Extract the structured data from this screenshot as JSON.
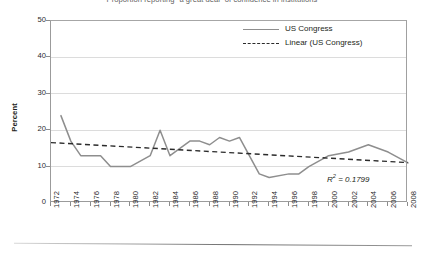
{
  "title": "Proportion reporting “a great deal” of confidence in institutions",
  "axes": {
    "y_title": "Percent",
    "y_ticks": [
      "50",
      "40",
      "30",
      "20",
      "10",
      "0"
    ],
    "x_ticks": [
      "1972",
      "1974",
      "1976",
      "1978",
      "1980",
      "1982",
      "1984",
      "1986",
      "1988",
      "1990",
      "1992",
      "1994",
      "1996",
      "1998",
      "2000",
      "2002",
      "2004",
      "2006",
      "2008"
    ]
  },
  "legend": {
    "items": [
      {
        "label": "US Congress",
        "style": "solid",
        "color": "#8e8e8e"
      },
      {
        "label": "Linear (US Congress)",
        "style": "dashed",
        "color": "#2b2b2b"
      }
    ]
  },
  "annotation": {
    "r_squared_prefix": "R",
    "r_squared_exponent": "2",
    "r_squared_value": " = 0.1799",
    "r_squared_full": "R2 = 0.1799"
  },
  "colors": {
    "series_line": "#8e8e8e",
    "trend_line": "#2b2b2b",
    "gridline": "#dcdcdc",
    "axis": "#9b9b9b",
    "text": "#231f20"
  },
  "chart_data": {
    "type": "line",
    "title": "Proportion reporting “a great deal” of confidence in institutions",
    "xlabel": "",
    "ylabel": "Percent",
    "xlim": [
      1972,
      2008
    ],
    "ylim": [
      0,
      50
    ],
    "y_ticks": [
      0,
      10,
      20,
      30,
      40,
      50
    ],
    "x_ticks": [
      1972,
      1974,
      1976,
      1978,
      1980,
      1982,
      1984,
      1986,
      1988,
      1990,
      1992,
      1994,
      1996,
      1998,
      2000,
      2002,
      2004,
      2006,
      2008
    ],
    "grid": "horizontal",
    "legend_position": "top-right",
    "x": [
      1973,
      1974,
      1975,
      1976,
      1977,
      1978,
      1980,
      1982,
      1983,
      1984,
      1986,
      1987,
      1988,
      1989,
      1990,
      1991,
      1993,
      1994,
      1996,
      1997,
      1998,
      2000,
      2002,
      2004,
      2006,
      2008
    ],
    "series": [
      {
        "name": "US Congress",
        "style": "solid",
        "color": "#8e8e8e",
        "values": [
          24,
          17,
          13,
          13,
          13,
          10,
          10,
          13,
          20,
          13,
          17,
          17,
          16,
          18,
          17,
          18,
          8,
          7,
          8,
          8,
          10,
          13,
          14,
          16,
          14,
          11
        ]
      },
      {
        "name": "Linear (US Congress)",
        "style": "dashed",
        "color": "#2b2b2b",
        "trend": true,
        "endpoints": [
          [
            1972,
            16.6
          ],
          [
            2008,
            11.1
          ]
        ],
        "r_squared": 0.1799
      }
    ]
  }
}
